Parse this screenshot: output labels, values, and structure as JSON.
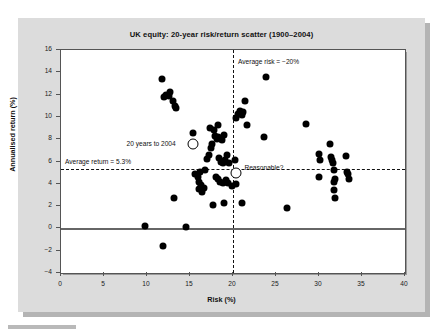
{
  "figure": {
    "title": "UK equity: 20-year risk/return scatter (1900–2004)",
    "panel_color": "#dcdcdc",
    "plot_bg": "#ffffff",
    "marker_color": "#000000"
  },
  "annotations": {
    "avg_risk": "Average risk = −20%",
    "avg_return": "Average return = 5.3%",
    "twenty_years": "20 years to 2004",
    "reasonable": "Reasonable?"
  },
  "chart_data": {
    "type": "scatter",
    "title": "UK equity: 20-year risk/return scatter (1900–2004)",
    "xlabel": "Risk (%)",
    "ylabel": "Annualised return (%)",
    "xlim": [
      0,
      40
    ],
    "ylim": [
      -4,
      16
    ],
    "xticks": [
      0,
      5,
      10,
      15,
      20,
      25,
      30,
      35,
      40
    ],
    "yticks": [
      -4,
      -2,
      0,
      2,
      4,
      6,
      8,
      10,
      12,
      14,
      16
    ],
    "grid": false,
    "legend": null,
    "reference_lines": [
      {
        "name": "average-return",
        "orientation": "horizontal",
        "value": 5.3,
        "style": "dashed",
        "label": "Average return = 5.3%"
      },
      {
        "name": "average-risk",
        "orientation": "vertical",
        "value": 20.0,
        "style": "dashed",
        "label": "Average risk = −20%"
      },
      {
        "name": "zero-return",
        "orientation": "horizontal",
        "value": 0,
        "style": "solid",
        "label": ""
      }
    ],
    "series": [
      {
        "name": "20-year rolling periods",
        "marker": "filled-circle",
        "points": [
          [
            9.8,
            0.2
          ],
          [
            11.9,
            -1.6
          ],
          [
            11.8,
            13.4
          ],
          [
            12.2,
            12.0
          ],
          [
            12.0,
            11.8
          ],
          [
            12.5,
            11.9
          ],
          [
            12.7,
            12.2
          ],
          [
            13.0,
            11.4
          ],
          [
            13.2,
            11.0
          ],
          [
            13.4,
            10.8
          ],
          [
            13.1,
            2.7
          ],
          [
            14.5,
            0.1
          ],
          [
            15.3,
            8.6
          ],
          [
            15.6,
            4.9
          ],
          [
            15.9,
            4.6
          ],
          [
            16.1,
            4.2
          ],
          [
            16.3,
            3.9
          ],
          [
            16.0,
            3.5
          ],
          [
            16.4,
            3.3
          ],
          [
            16.6,
            3.6
          ],
          [
            16.2,
            5.1
          ],
          [
            16.8,
            5.2
          ],
          [
            17.0,
            6.2
          ],
          [
            17.2,
            6.6
          ],
          [
            17.4,
            7.2
          ],
          [
            17.6,
            7.6
          ],
          [
            17.3,
            9.0
          ],
          [
            17.8,
            8.8
          ],
          [
            17.9,
            8.3
          ],
          [
            18.1,
            8.0
          ],
          [
            18.3,
            8.2
          ],
          [
            18.5,
            8.1
          ],
          [
            18.7,
            7.9
          ],
          [
            18.9,
            8.4
          ],
          [
            18.2,
            9.3
          ],
          [
            18.4,
            6.3
          ],
          [
            18.6,
            6.0
          ],
          [
            18.8,
            5.9
          ],
          [
            18.0,
            4.6
          ],
          [
            18.2,
            4.4
          ],
          [
            18.5,
            4.2
          ],
          [
            18.8,
            4.1
          ],
          [
            17.7,
            2.1
          ],
          [
            18.9,
            2.3
          ],
          [
            19.1,
            6.1
          ],
          [
            19.3,
            6.6
          ],
          [
            19.5,
            5.9
          ],
          [
            19.2,
            4.3
          ],
          [
            19.4,
            4.1
          ],
          [
            19.9,
            3.8
          ],
          [
            20.2,
            6.1
          ],
          [
            20.4,
            9.9
          ],
          [
            20.6,
            10.3
          ],
          [
            20.8,
            10.5
          ],
          [
            21.0,
            10.2
          ],
          [
            21.2,
            10.4
          ],
          [
            21.4,
            11.4
          ],
          [
            21.6,
            9.3
          ],
          [
            20.3,
            4.0
          ],
          [
            21.0,
            2.3
          ],
          [
            23.8,
            13.6
          ],
          [
            23.6,
            8.2
          ],
          [
            26.3,
            1.8
          ],
          [
            28.5,
            9.4
          ],
          [
            30.0,
            6.7
          ],
          [
            30.1,
            6.1
          ],
          [
            30.0,
            4.6
          ],
          [
            31.3,
            7.6
          ],
          [
            31.4,
            6.4
          ],
          [
            31.5,
            6.1
          ],
          [
            31.6,
            5.9
          ],
          [
            31.8,
            5.2
          ],
          [
            31.9,
            4.4
          ],
          [
            31.7,
            4.2
          ],
          [
            31.8,
            3.4
          ],
          [
            31.9,
            2.7
          ],
          [
            33.1,
            6.5
          ],
          [
            33.3,
            5.1
          ],
          [
            33.4,
            4.9
          ],
          [
            33.5,
            4.4
          ]
        ]
      },
      {
        "name": "highlighted markers",
        "marker": "open-circle",
        "points": [
          [
            15.3,
            7.6
          ],
          [
            20.4,
            5.0
          ]
        ],
        "labels": [
          "20 years to 2004",
          "Reasonable?"
        ]
      }
    ]
  }
}
